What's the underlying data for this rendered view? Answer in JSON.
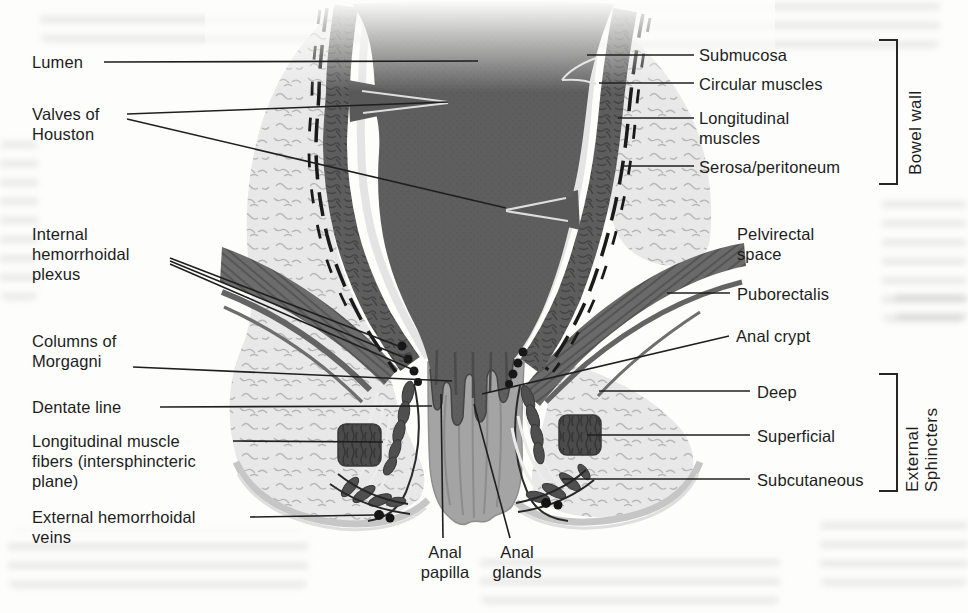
{
  "figure": {
    "kind": "anatomical cross-section diagram (scanned book figure, grayscale)",
    "labels": {
      "lumen": {
        "text": "Lumen"
      },
      "valves_of_houston": {
        "text": "Valves of\nHouston"
      },
      "internal_hemorrhoidal_plexus": {
        "text": "Internal\nhemorrhoidal\nplexus"
      },
      "columns_of_morgagni": {
        "text": "Columns of\nMorgagni"
      },
      "dentate_line": {
        "text": "Dentate line"
      },
      "longitudinal_muscle_fibers": {
        "text": "Longitudinal muscle\nfibers (intersphincteric\nplane)"
      },
      "external_hemorrhoidal_veins": {
        "text": "External hemorrhoidal\nveins"
      },
      "anal_papilla": {
        "text": "Anal\npapilla"
      },
      "anal_glands": {
        "text": "Anal\nglands"
      },
      "submucosa": {
        "text": "Submucosa"
      },
      "circular_muscles": {
        "text": "Circular muscles"
      },
      "longitudinal_muscles": {
        "text": "Longitudinal\nmuscles"
      },
      "serosa_peritoneum": {
        "text": "Serosa/peritoneum"
      },
      "pelvirectal_space": {
        "text": "Pelvirectal\nspace"
      },
      "puborectalis": {
        "text": "Puborectalis"
      },
      "anal_crypt": {
        "text": "Anal crypt"
      },
      "deep": {
        "text": "Deep"
      },
      "superficial": {
        "text": "Superficial"
      },
      "subcutaneous": {
        "text": "Subcutaneous"
      }
    },
    "brackets": {
      "bowel_wall": {
        "text": "Bowel wall"
      },
      "external_sphincters": {
        "text": "External\nSphincters"
      }
    },
    "colors": {
      "ink": "#1f1f1f",
      "lumen_gray": "#5e5e5e",
      "muscle_gray": "#5d5d5d",
      "submucosa_light": "#e4e4e4",
      "fat_light": "#e8e8e8",
      "levator_gray": "#6c6c6c",
      "sphincter_dark": "#4b4b4b",
      "anal_canal_gray": "#a4a4a4",
      "skin_gray": "#c6c6c6",
      "vein_dot": "#161616"
    }
  }
}
